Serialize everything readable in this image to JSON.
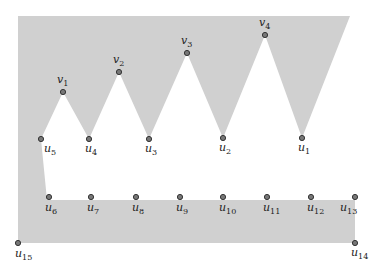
{
  "diagram": {
    "colors": {
      "region_fill": "#d0d0d0",
      "vertex_fill": "#777777",
      "vertex_stroke": "#333333",
      "label": "#222222",
      "background": "#ffffff"
    },
    "region_outline": [
      [
        18,
        16
      ],
      [
        350,
        16
      ],
      [
        302,
        138
      ],
      [
        265,
        35
      ],
      [
        223,
        138
      ],
      [
        187,
        53
      ],
      [
        149,
        139
      ],
      [
        119,
        72
      ],
      [
        89,
        139
      ],
      [
        63,
        92
      ],
      [
        41,
        139
      ],
      [
        47,
        200
      ],
      [
        355,
        200
      ],
      [
        355,
        243
      ],
      [
        18,
        243
      ]
    ],
    "vertices": [
      {
        "id": "v1",
        "base": "v",
        "sub": "1",
        "x": 63,
        "y": 92,
        "lx": 57,
        "ly": 83
      },
      {
        "id": "v2",
        "base": "v",
        "sub": "2",
        "x": 119,
        "y": 72,
        "lx": 113,
        "ly": 63
      },
      {
        "id": "v3",
        "base": "v",
        "sub": "3",
        "x": 187,
        "y": 53,
        "lx": 181,
        "ly": 44
      },
      {
        "id": "v4",
        "base": "v",
        "sub": "4",
        "x": 265,
        "y": 35,
        "lx": 259,
        "ly": 26
      },
      {
        "id": "u1",
        "base": "u",
        "sub": "1",
        "x": 302,
        "y": 138,
        "lx": 298,
        "ly": 151
      },
      {
        "id": "u2",
        "base": "u",
        "sub": "2",
        "x": 223,
        "y": 138,
        "lx": 219,
        "ly": 151
      },
      {
        "id": "u3",
        "base": "u",
        "sub": "3",
        "x": 149,
        "y": 139,
        "lx": 145,
        "ly": 152
      },
      {
        "id": "u4",
        "base": "u",
        "sub": "4",
        "x": 89,
        "y": 139,
        "lx": 85,
        "ly": 152
      },
      {
        "id": "u5",
        "base": "u",
        "sub": "5",
        "x": 41,
        "y": 139,
        "lx": 44,
        "ly": 152
      },
      {
        "id": "u6",
        "base": "u",
        "sub": "6",
        "x": 49,
        "y": 197,
        "lx": 45,
        "ly": 211
      },
      {
        "id": "u7",
        "base": "u",
        "sub": "7",
        "x": 91,
        "y": 197,
        "lx": 87,
        "ly": 211
      },
      {
        "id": "u8",
        "base": "u",
        "sub": "8",
        "x": 136,
        "y": 197,
        "lx": 132,
        "ly": 211
      },
      {
        "id": "u9",
        "base": "u",
        "sub": "9",
        "x": 180,
        "y": 197,
        "lx": 176,
        "ly": 211
      },
      {
        "id": "u10",
        "base": "u",
        "sub": "10",
        "x": 223,
        "y": 197,
        "lx": 219,
        "ly": 211
      },
      {
        "id": "u11",
        "base": "u",
        "sub": "11",
        "x": 267,
        "y": 197,
        "lx": 263,
        "ly": 211
      },
      {
        "id": "u12",
        "base": "u",
        "sub": "12",
        "x": 311,
        "y": 197,
        "lx": 307,
        "ly": 211
      },
      {
        "id": "u13",
        "base": "u",
        "sub": "13",
        "x": 355,
        "y": 197,
        "lx": 340,
        "ly": 211
      },
      {
        "id": "u14",
        "base": "u",
        "sub": "14",
        "x": 355,
        "y": 243,
        "lx": 351,
        "ly": 256
      },
      {
        "id": "u15",
        "base": "u",
        "sub": "15",
        "x": 18,
        "y": 243,
        "lx": 15,
        "ly": 257
      }
    ]
  }
}
